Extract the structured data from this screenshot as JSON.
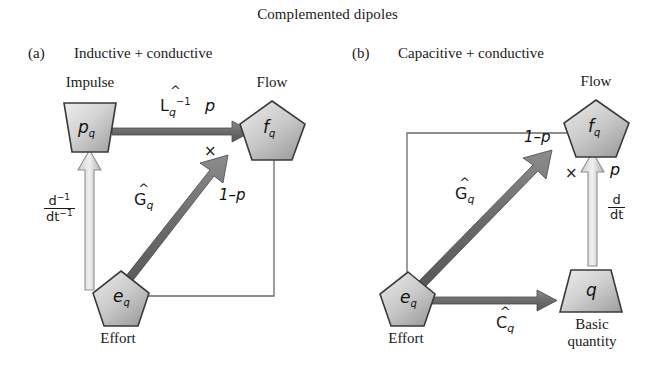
{
  "figure": {
    "title": "Complemented dipoles",
    "panels": [
      {
        "tag": "(a)",
        "heading": "Inductive + conductive",
        "nodes": [
          {
            "id": "p_q",
            "symbol": "p",
            "sub": "q",
            "caption": "Impulse",
            "shape": "trapezoid"
          },
          {
            "id": "f_q",
            "symbol": "f",
            "sub": "q",
            "caption": "Flow",
            "shape": "pentagon"
          },
          {
            "id": "e_q",
            "symbol": "e",
            "sub": "q",
            "caption": "Effort",
            "shape": "pentagon"
          }
        ],
        "edges": [
          {
            "from": "p_q",
            "to": "f_q",
            "operator_base": "L",
            "operator_hat": "^",
            "operator_sub": "q",
            "operator_exp": "−1",
            "weight": "p"
          },
          {
            "from": "e_q",
            "to": "f_q",
            "operator_base": "G",
            "operator_hat": "^",
            "operator_sub": "q",
            "operator_exp": "",
            "weight": "1–p"
          },
          {
            "from": "e_q",
            "to": "p_q",
            "operator_fraction_num": "d",
            "operator_fraction_num_exp": "−1",
            "operator_fraction_den": "dt",
            "operator_fraction_den_exp": "−1"
          }
        ],
        "multiplier": "×"
      },
      {
        "tag": "(b)",
        "heading": "Capacitive + conductive",
        "nodes": [
          {
            "id": "f_q",
            "symbol": "f",
            "sub": "q",
            "caption": "Flow",
            "shape": "pentagon"
          },
          {
            "id": "e_q",
            "symbol": "e",
            "sub": "q",
            "caption": "Effort",
            "shape": "pentagon"
          },
          {
            "id": "q",
            "symbol": "q",
            "sub": "",
            "caption": "Basic quantity",
            "caption_line1": "Basic",
            "caption_line2": "quantity",
            "shape": "trapezoid"
          }
        ],
        "edges": [
          {
            "from": "e_q",
            "to": "f_q",
            "operator_base": "G",
            "operator_hat": "^",
            "operator_sub": "q",
            "operator_exp": "",
            "weight": "1–p"
          },
          {
            "from": "e_q",
            "to": "q",
            "operator_base": "C",
            "operator_hat": "^",
            "operator_sub": "q",
            "operator_exp": "",
            "weight": ""
          },
          {
            "from": "q",
            "to": "f_q",
            "operator_fraction_num": "d",
            "operator_fraction_num_exp": "",
            "operator_fraction_den": "dt",
            "operator_fraction_den_exp": "",
            "weight": "p"
          }
        ],
        "multiplier": "×"
      }
    ],
    "colors": {
      "node_fill_light": "#e2e2e2",
      "node_fill_dark": "#9a9a9a",
      "node_stroke": "#3a3a3a",
      "arrow_dark": "#6f6f6f",
      "arrow_light": "#bdbdbd",
      "thin_line": "#6a6a6a",
      "text": "#1a1a1a",
      "background": "#ffffff"
    }
  }
}
